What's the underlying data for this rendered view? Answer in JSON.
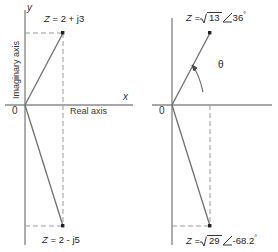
{
  "figure": {
    "stroke_color": "#6f6f6f",
    "text_color": "#222222",
    "background": "#ffffff"
  },
  "left_panel": {
    "name": "rectangular-form-diagram",
    "axes": {
      "vertical_letter": "y",
      "horizontal_letter": "x",
      "origin_label": "0",
      "imaginary_axis_label": "Imaginary axis",
      "real_axis_label": "Real axis"
    },
    "points": [
      {
        "id": "z-upper-rect",
        "label_full": "Z = 2 + j3",
        "z_symbol": "Z",
        "equals": "=",
        "expression": "2 + j3",
        "real": 2,
        "imag": 3,
        "quadrant": "first"
      },
      {
        "id": "z-lower-rect",
        "label_full": "Z = 2 - j5",
        "z_symbol": "Z",
        "equals": "=",
        "expression": "2 - j5",
        "real": 2,
        "imag": -5,
        "quadrant": "fourth"
      }
    ]
  },
  "right_panel": {
    "name": "polar-form-diagram",
    "axes": {
      "origin_label": "0"
    },
    "angle_marker": {
      "symbol": "θ",
      "name": "theta-angle-arc"
    },
    "points": [
      {
        "id": "z-upper-polar",
        "z_symbol": "Z",
        "equals": "=",
        "radicand": "13",
        "angle": "36",
        "degree_symbol": "°",
        "label_full": "Z = √13 ∠36°",
        "magnitude_value": 3.606,
        "angle_value": 36
      },
      {
        "id": "z-lower-polar",
        "z_symbol": "Z",
        "equals": "=",
        "radicand": "29",
        "angle": "-68.2",
        "degree_symbol": "°",
        "label_full": "Z = √29 ∠-68.2°",
        "magnitude_value": 5.385,
        "angle_value": -68.2
      }
    ]
  }
}
